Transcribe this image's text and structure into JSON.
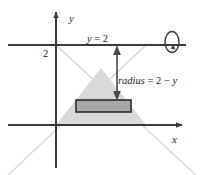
{
  "figure": {
    "kind": "math-diagram",
    "background_color": "#ffffff",
    "axes": {
      "x_label": "x",
      "y_label": "y",
      "axis_color": "#3b3b3b",
      "origin": {
        "x": 56,
        "y": 125
      }
    },
    "tick": {
      "label": "2",
      "value": 2,
      "position": {
        "x": 47,
        "y": 53
      }
    },
    "axis_of_revolution": {
      "label": "y = 2",
      "label_parts": {
        "lhs": "y",
        "op": "=",
        "rhs": "2"
      },
      "line_color": "#3b3b3b",
      "line_y": 45
    },
    "rotation_icon": {
      "name": "revolution-arrow-icon",
      "center": {
        "x": 172,
        "y": 42
      },
      "rx": 7,
      "ry": 10
    },
    "radius_annotation": {
      "label": "radius = 2 − y",
      "label_parts": {
        "name": "radius",
        "eq": "=",
        "expr": "2 − y"
      },
      "arrow_top": {
        "x": 117,
        "y": 45
      },
      "arrow_bottom": {
        "x": 117,
        "y": 101
      },
      "arrow_color": "#4a4a4a"
    },
    "region": {
      "name": "shaded-triangle",
      "fill_color": "#d9d9d9",
      "apex": {
        "x": 101,
        "y": 68
      },
      "base_left": {
        "x": 56,
        "y": 125
      },
      "base_right": {
        "x": 146,
        "y": 125
      }
    },
    "disk": {
      "name": "representative-disk",
      "fill_color": "#a8a8a8",
      "stroke_color": "#2b2b2b",
      "x": 76,
      "y": 100,
      "width": 55,
      "height": 12
    },
    "construction_lines": {
      "color": "#cfcfcf",
      "lines": [
        {
          "x1": 56,
          "y1": 45,
          "x2": 196,
          "y2": 175
        },
        {
          "x1": 146,
          "y1": 45,
          "x2": 8,
          "y2": 175
        }
      ]
    }
  }
}
